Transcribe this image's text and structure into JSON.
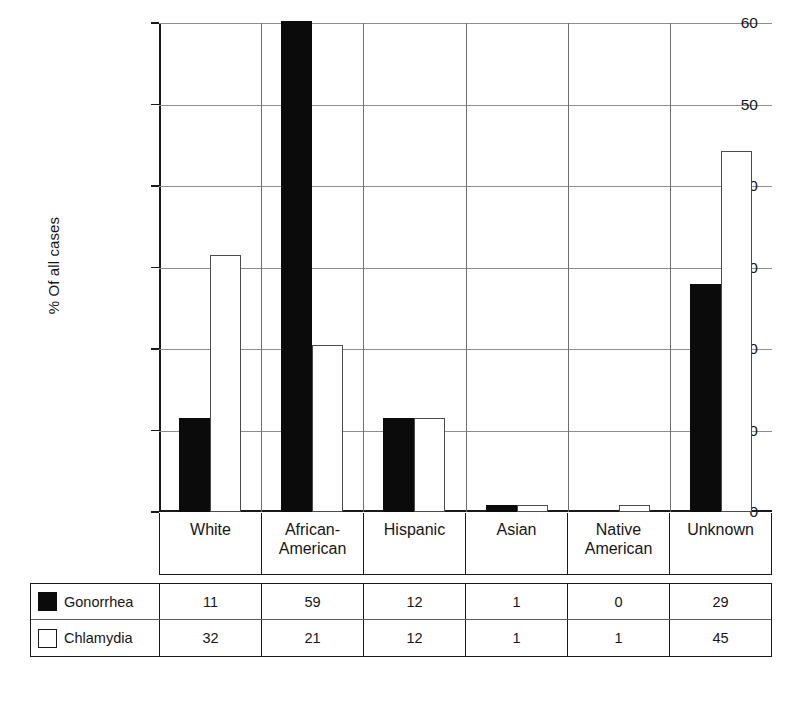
{
  "chart_data": {
    "type": "bar",
    "title": "",
    "subtitle": "",
    "xlabel": "",
    "ylabel": "% Of all cases",
    "ylim": [
      0,
      60
    ],
    "yticks": [
      0,
      10,
      20,
      30,
      40,
      50,
      60
    ],
    "grid": true,
    "legend_position": "bottom-table",
    "categories": [
      "White",
      "African-American",
      "Hispanic",
      "Asian",
      "Native American",
      "Unknown"
    ],
    "category_lines": [
      [
        "White"
      ],
      [
        "African-",
        "American"
      ],
      [
        "Hispanic"
      ],
      [
        "Asian"
      ],
      [
        "Native",
        "American"
      ],
      [
        "Unknown"
      ]
    ],
    "series": [
      {
        "name": "Gonorrhea",
        "color": "#0b0b0b",
        "style": "filled",
        "values": [
          11.5,
          60.2,
          11.5,
          0.8,
          0.0,
          28.0
        ],
        "table_values": [
          "11",
          "59",
          "12",
          "1",
          "0",
          "29"
        ]
      },
      {
        "name": "Chlamydia",
        "color": "#ffffff",
        "style": "outlined",
        "values": [
          31.5,
          20.5,
          11.5,
          0.8,
          0.8,
          44.3
        ],
        "table_values": [
          "32",
          "21",
          "12",
          "1",
          "1",
          "45"
        ]
      }
    ]
  },
  "legend": {
    "rows": [
      {
        "label": "Gonorrhea",
        "swatch": "filled-black-square"
      },
      {
        "label": "Chlamydia",
        "swatch": "outlined-white-square"
      }
    ]
  }
}
